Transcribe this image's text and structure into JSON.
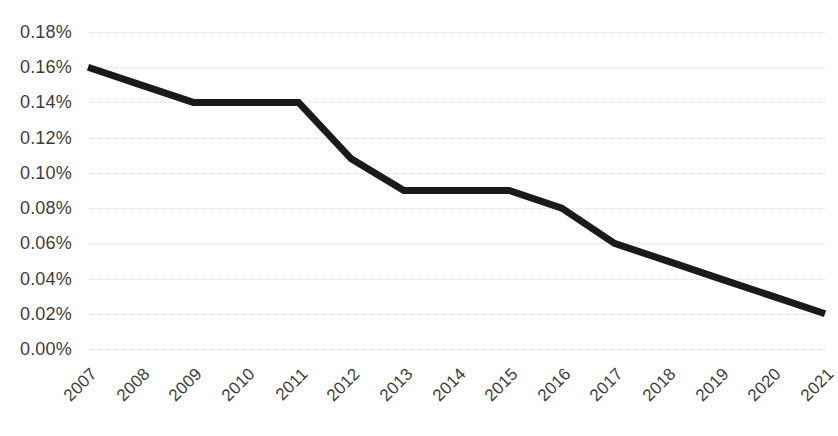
{
  "chart_data": {
    "type": "line",
    "title": "",
    "subtitle": "",
    "xlabel": "",
    "ylabel": "",
    "categories": [
      "2007",
      "2008",
      "2009",
      "2010",
      "2011",
      "2012",
      "2013",
      "2014",
      "2015",
      "2016",
      "2017",
      "2018",
      "2019",
      "2020",
      "2021"
    ],
    "values": [
      0.16,
      0.15,
      0.14,
      0.14,
      0.14,
      0.108,
      0.09,
      0.09,
      0.09,
      0.08,
      0.06,
      0.05,
      0.04,
      0.03,
      0.02
    ],
    "series": [
      {
        "name": "",
        "values": [
          0.16,
          0.15,
          0.14,
          0.14,
          0.14,
          0.108,
          0.09,
          0.09,
          0.09,
          0.08,
          0.06,
          0.05,
          0.04,
          0.03,
          0.02
        ]
      }
    ],
    "y_tick_labels": [
      "0.18%",
      "0.16%",
      "0.14%",
      "0.12%",
      "0.10%",
      "0.08%",
      "0.06%",
      "0.04%",
      "0.02%",
      "0.00%"
    ],
    "y_tick_values": [
      0.18,
      0.16,
      0.14,
      0.12,
      0.1,
      0.08,
      0.06,
      0.04,
      0.02,
      0.0
    ],
    "ylim": [
      0.0,
      0.18
    ],
    "y_tick_step": 0.02,
    "value_format": "percent",
    "grid": "horizontal-only",
    "gridline_style": "dotted",
    "legend": "none",
    "x_label_rotation": -45,
    "colors": {
      "line": "#1a1a1a",
      "gridline": "#dddddd",
      "text": "#3d3d3d",
      "background": "#ffffff"
    },
    "line_width_px": 7
  },
  "layout": {
    "plot_left": 88,
    "plot_right": 825,
    "plot_top": 32,
    "plot_bottom": 349
  }
}
